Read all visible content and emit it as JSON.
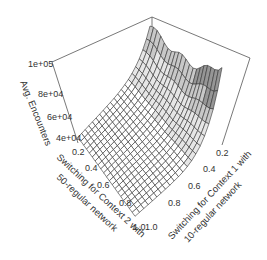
{
  "chart_data": {
    "type": "surface",
    "title": "",
    "zlabel": "Avg. Encounters",
    "xlabel": "Switching for Context 2 with 50-regular network",
    "ylabel": "Switching for Context 1 with 10-regular network",
    "x_ticks": [
      "0.2",
      "0.4",
      "0.6",
      "0.8",
      "1.0"
    ],
    "y_ticks": [
      "0.2",
      "0.4",
      "0.6",
      "0.8",
      "1.0"
    ],
    "z_ticks": [
      "4e+04",
      "6e+04",
      "8e+04",
      "1e+05"
    ],
    "xlim": [
      0,
      1
    ],
    "ylim": [
      0,
      1
    ],
    "zlim": [
      30000,
      100000
    ],
    "grid_size": 20,
    "sample_points": [
      {
        "x": 1.0,
        "y": 1.0,
        "z": 35000
      },
      {
        "x": 0.0,
        "y": 1.0,
        "z": 38000
      },
      {
        "x": 1.0,
        "y": 0.0,
        "z": 62000
      },
      {
        "x": 0.5,
        "y": 0.0,
        "z": 70000
      },
      {
        "x": 0.0,
        "y": 0.0,
        "z": 100000
      },
      {
        "x": 0.5,
        "y": 0.5,
        "z": 36000
      }
    ],
    "shading": {
      "low": "#ffffff",
      "mid": "#d8d8d8",
      "high": "#8a8a8a"
    }
  },
  "axes": {
    "z_label": "Avg. Encounters",
    "x_label_line1": "Switching for Context 2 with",
    "x_label_line2": "50-regular network",
    "y_label_line1": "Switching for Context 1 with",
    "y_label_line2": "10-regular network"
  }
}
